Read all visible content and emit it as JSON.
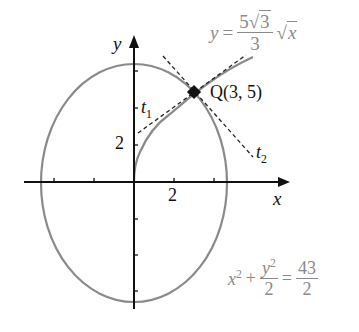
{
  "diagram": {
    "axes": {
      "x_label": "x",
      "y_label": "y",
      "x_tick_label": "2",
      "y_tick_label": "2",
      "x_ticks": [
        -4,
        -2,
        2,
        4
      ],
      "y_ticks": [
        -6,
        -4,
        -2,
        2,
        4,
        6
      ]
    },
    "curves": [
      {
        "name": "ellipse",
        "equation_parts": {
          "lhs_x": "x",
          "exp": "2",
          "plus": "+",
          "num_y": "y",
          "den": "2",
          "eq": "=",
          "rhs_num": "43",
          "rhs_den": "2"
        },
        "color": "#8a8a8a"
      },
      {
        "name": "sqrt-curve",
        "equation_parts": {
          "y": "y",
          "eq": "=",
          "num_coef": "5",
          "num_rad": "3",
          "den": "3",
          "rad_var": "x"
        },
        "color": "#8a8a8a"
      }
    ],
    "tangents": [
      {
        "label": "t",
        "sub": "1"
      },
      {
        "label": "t",
        "sub": "2"
      }
    ],
    "point": {
      "label": "Q(3, 5)",
      "x": 3,
      "y": 5
    }
  }
}
